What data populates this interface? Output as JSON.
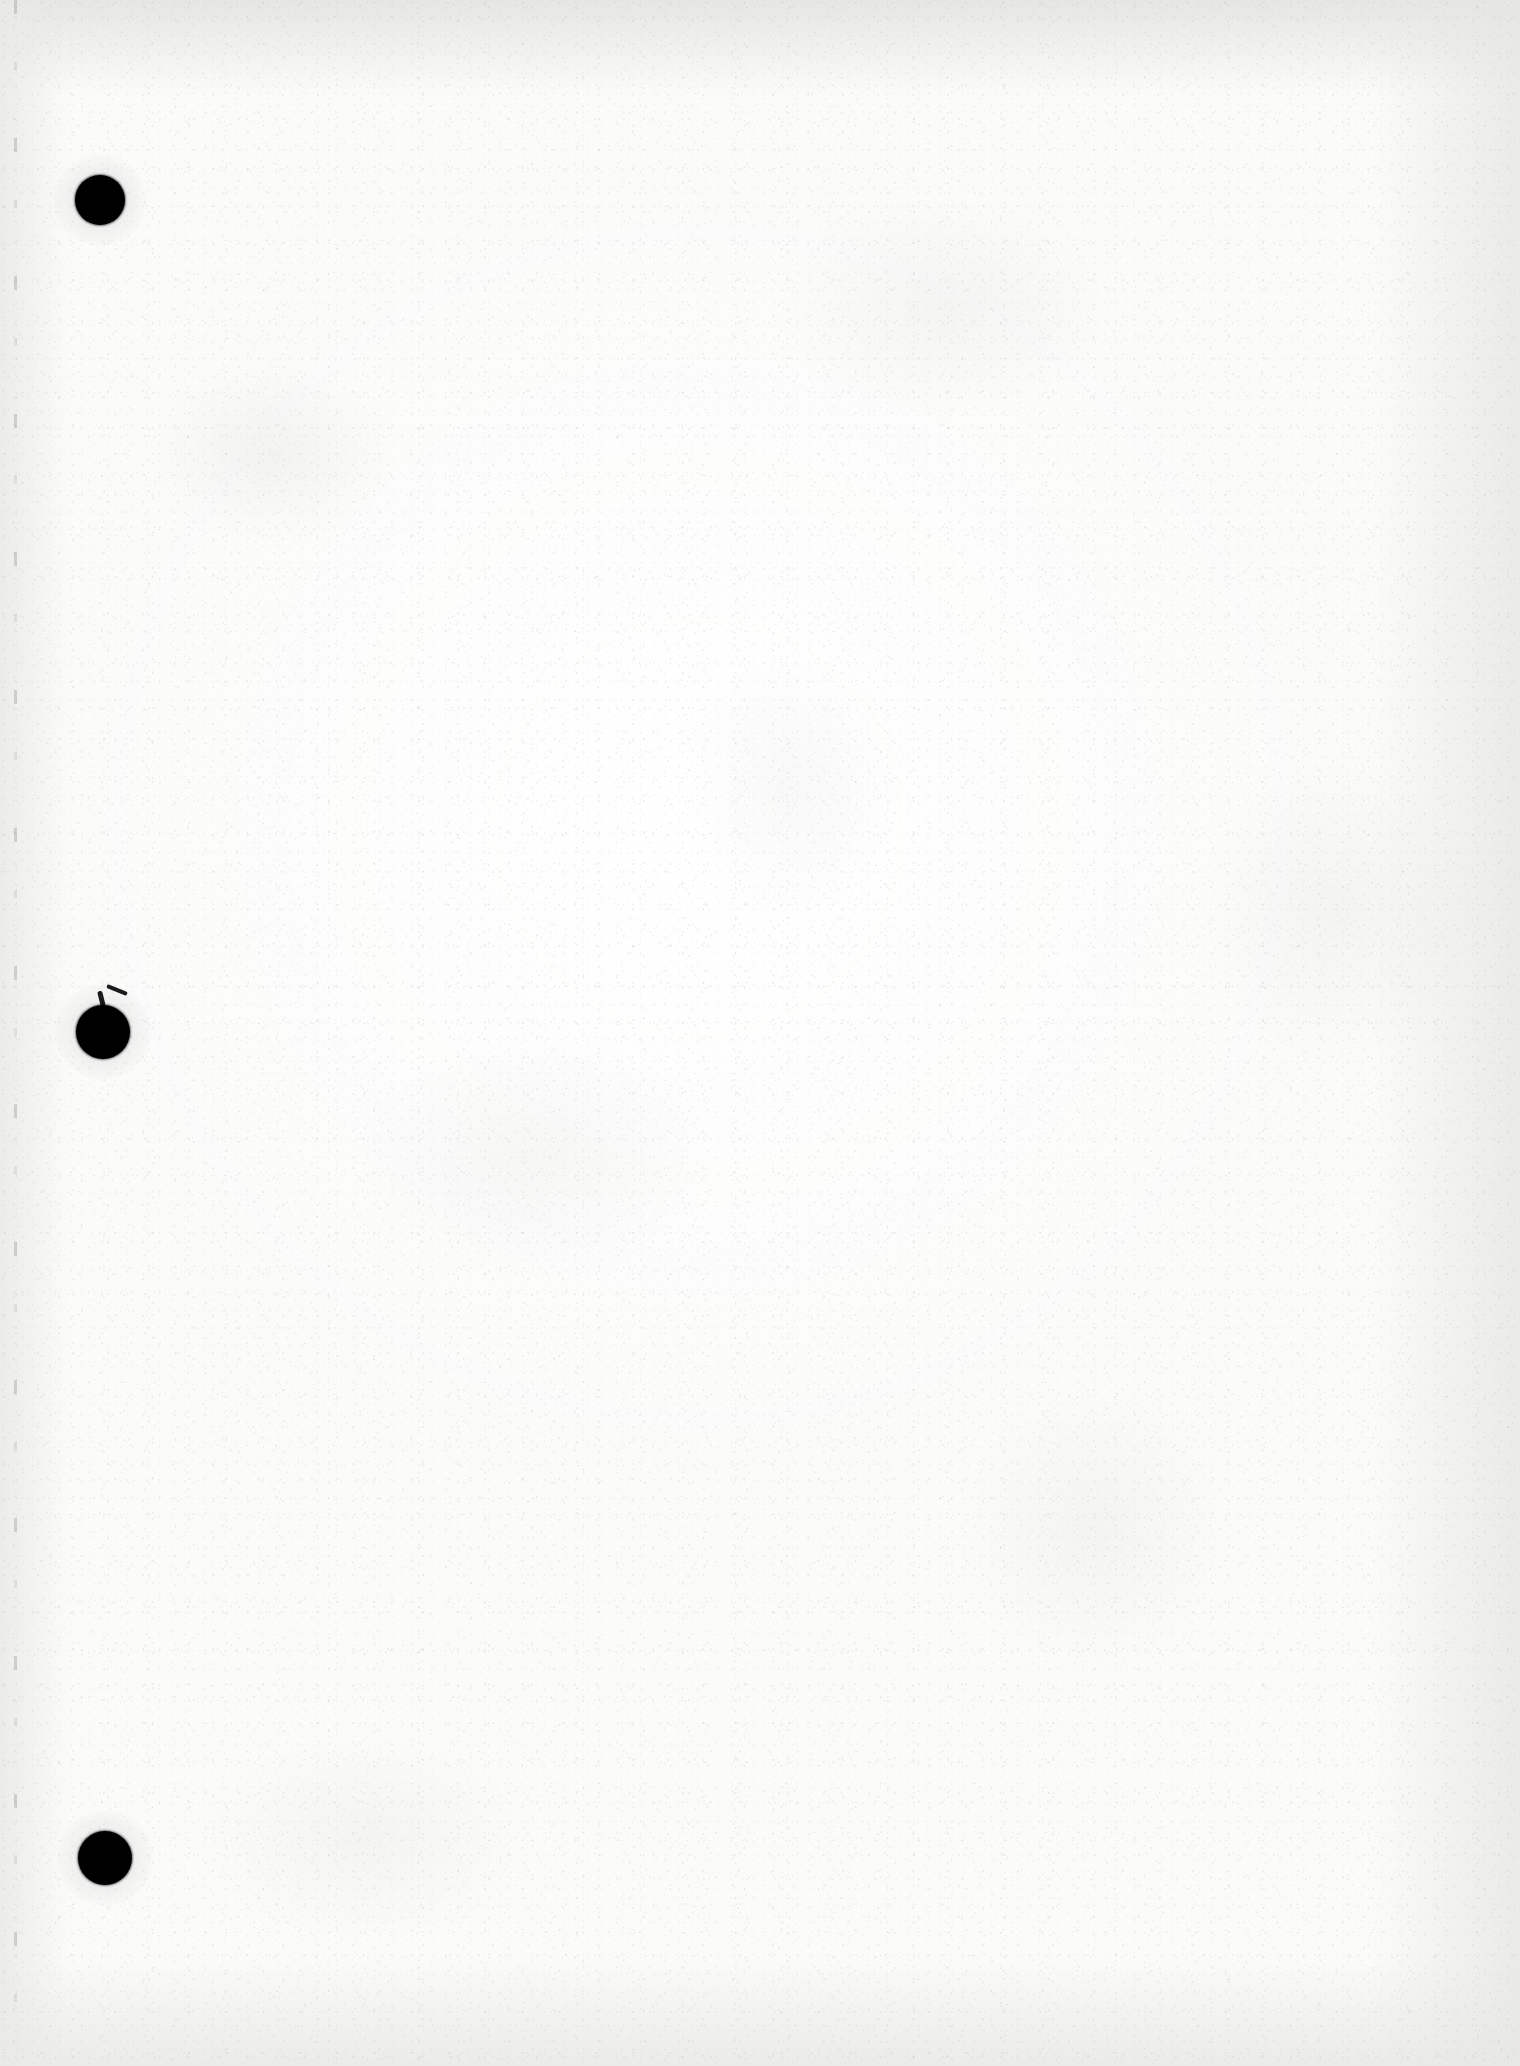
{
  "document": {
    "kind": "scanned-page",
    "content_text": "",
    "description": "Blank scanned sheet of paper, no printed or handwritten text visible",
    "page_width_px": 1520,
    "page_height_px": 2066,
    "paper_color": "#fbfbfa",
    "ink_color": "#000000",
    "edge_shadow_color": "#e6e6e4"
  },
  "artifacts": {
    "punch_holes": [
      {
        "name": "punch-hole-top",
        "cx": 100,
        "cy": 200,
        "r": 25,
        "tear": false
      },
      {
        "name": "punch-hole-middle",
        "cx": 103,
        "cy": 1032,
        "r": 27,
        "tear": true
      },
      {
        "name": "punch-hole-bottom",
        "cx": 105,
        "cy": 1858,
        "r": 27,
        "tear": false
      }
    ],
    "scan_edge_line": {
      "x": 14,
      "color": "#787878"
    }
  }
}
